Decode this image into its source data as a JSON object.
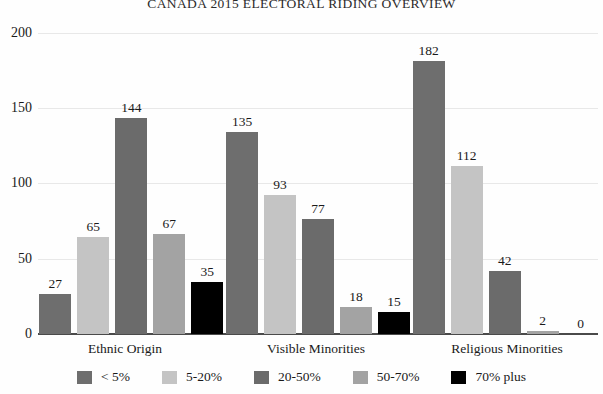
{
  "chart_data": {
    "type": "bar",
    "title": "CANADA 2015 ELECTORAL RIDING OVERVIEW",
    "xlabel": "",
    "ylabel": "",
    "ylim": [
      0,
      200
    ],
    "yticks": [
      0,
      50,
      100,
      150,
      200
    ],
    "grid": true,
    "legend_position": "bottom",
    "categories": [
      "Ethnic Origin",
      "Visible Minorities",
      "Religious Minorities"
    ],
    "series": [
      {
        "name": "< 5%",
        "color": "#6e6e6e",
        "values": [
          27,
          135,
          182
        ]
      },
      {
        "name": "5-20%",
        "color": "#c4c4c4",
        "values": [
          65,
          93,
          112
        ]
      },
      {
        "name": "20-50%",
        "color": "#6b6b6b",
        "values": [
          144,
          77,
          42
        ]
      },
      {
        "name": "50-70%",
        "color": "#a3a3a3",
        "values": [
          67,
          18,
          2
        ]
      },
      {
        "name": "70% plus",
        "color": "#000000",
        "values": [
          35,
          15,
          0
        ]
      }
    ]
  },
  "axis": {
    "tick_0": "0",
    "tick_50": "50",
    "tick_100": "100",
    "tick_150": "150",
    "tick_200": "200"
  },
  "groups": {
    "g0": "Ethnic Origin",
    "g1": "Visible Minorities",
    "g2": "Religious Minorities"
  },
  "legend": {
    "items": [
      {
        "label": "< 5%"
      },
      {
        "label": "5-20%"
      },
      {
        "label": "20-50%"
      },
      {
        "label": "50-70%"
      },
      {
        "label": "70% plus"
      }
    ]
  },
  "values": {
    "ethnic": {
      "v0": "27",
      "v1": "65",
      "v2": "144",
      "v3": "67",
      "v4": "35"
    },
    "visible": {
      "v0": "135",
      "v1": "93",
      "v2": "77",
      "v3": "18",
      "v4": "15"
    },
    "religious": {
      "v0": "182",
      "v1": "112",
      "v2": "42",
      "v3": "2",
      "v4": "0"
    }
  }
}
